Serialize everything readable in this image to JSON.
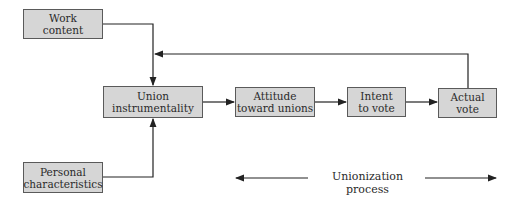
{
  "diagram": {
    "nodes": {
      "work_content": {
        "line1": "Work",
        "line2": "content"
      },
      "personal_characteristics": {
        "line1": "Personal",
        "line2": "characteristics"
      },
      "union_instrumentality": {
        "line1": "Union",
        "line2": "instrumentality"
      },
      "attitude_toward_unions": {
        "line1": "Attitude",
        "line2": "toward unions"
      },
      "intent_to_vote": {
        "line1": "Intent",
        "line2": "to vote"
      },
      "actual_vote": {
        "line1": "Actual",
        "line2": "vote"
      }
    },
    "edges": [
      {
        "from": "Work content",
        "to": "Union instrumentality"
      },
      {
        "from": "Personal characteristics",
        "to": "Union instrumentality"
      },
      {
        "from": "Union instrumentality",
        "to": "Attitude toward unions"
      },
      {
        "from": "Attitude toward unions",
        "to": "Intent to vote"
      },
      {
        "from": "Intent to vote",
        "to": "Actual vote"
      },
      {
        "from": "Actual vote",
        "to": "Union instrumentality (feedback)"
      }
    ],
    "process_label": "Unionization process",
    "colors": {
      "box_fill": "#d6d6d6",
      "box_border": "#5a5a5a",
      "line": "#222222"
    }
  }
}
